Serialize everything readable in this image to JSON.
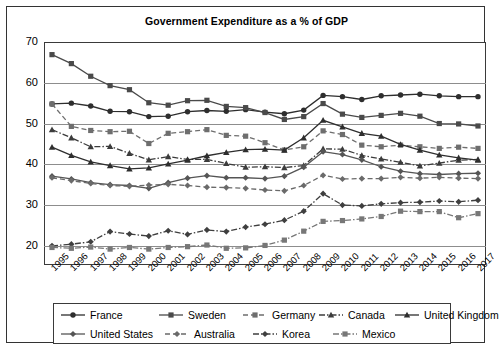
{
  "chart_data": {
    "type": "line",
    "title": "Government Expenditure as a % of GDP",
    "xlabel": "",
    "ylabel": "",
    "ylim": [
      15.3,
      70
    ],
    "yticks": [
      20,
      30,
      40,
      50,
      60,
      70
    ],
    "grid": true,
    "legend_position": "bottom",
    "categories": [
      "1995",
      "1996",
      "1997",
      "1998",
      "1999",
      "2000",
      "2001",
      "2002",
      "2003",
      "2004",
      "2005",
      "2006",
      "2007",
      "2008",
      "2009",
      "2010",
      "2011",
      "2012",
      "2013",
      "2014",
      "2015",
      "2016",
      "2017"
    ],
    "series": [
      {
        "name": "France",
        "marker": "circle",
        "dash": "solid",
        "color": "#2e2e2e",
        "values": [
          54.8,
          55.0,
          54.3,
          53.0,
          52.9,
          51.7,
          51.8,
          52.9,
          53.2,
          53.0,
          53.4,
          52.8,
          52.4,
          53.3,
          56.9,
          56.6,
          55.9,
          56.8,
          57.0,
          57.2,
          56.8,
          56.6,
          56.6
        ]
      },
      {
        "name": "Sweden",
        "marker": "square",
        "dash": "solid",
        "color": "#4a4a4a",
        "values": [
          66.9,
          64.7,
          61.6,
          59.3,
          58.3,
          55.1,
          54.5,
          55.6,
          55.7,
          54.2,
          53.9,
          52.7,
          51.0,
          51.7,
          54.9,
          52.3,
          51.5,
          52.0,
          52.5,
          51.8,
          50.0,
          49.9,
          49.4
        ]
      },
      {
        "name": "Germany",
        "marker": "square",
        "dash": "dashed",
        "color": "#6e6e6e",
        "values": [
          54.8,
          49.3,
          48.3,
          48.0,
          48.1,
          45.1,
          47.6,
          48.0,
          48.5,
          47.1,
          46.9,
          45.3,
          43.5,
          44.3,
          48.2,
          47.3,
          44.7,
          44.3,
          44.7,
          44.3,
          43.9,
          44.2,
          43.9
        ]
      },
      {
        "name": "Canada",
        "marker": "triangle",
        "dash": "dashdot",
        "color": "#3c3c3c",
        "values": [
          48.5,
          46.5,
          44.3,
          44.4,
          42.7,
          41.1,
          41.9,
          41.2,
          41.2,
          40.2,
          39.3,
          39.4,
          39.2,
          39.7,
          43.8,
          43.7,
          42.2,
          41.3,
          40.5,
          39.6,
          40.3,
          41.0,
          41.2
        ]
      },
      {
        "name": "United Kingdom",
        "marker": "triangle",
        "dash": "solid",
        "color": "#2e2e2e",
        "values": [
          44.2,
          42.2,
          40.6,
          39.7,
          38.9,
          39.1,
          40.1,
          41.0,
          42.1,
          42.9,
          43.6,
          43.7,
          43.5,
          46.5,
          50.8,
          49.2,
          47.6,
          46.9,
          44.9,
          43.5,
          42.3,
          41.6,
          41.0
        ]
      },
      {
        "name": "United States",
        "marker": "diamond",
        "dash": "solid",
        "color": "#555555",
        "values": [
          37.1,
          36.4,
          35.5,
          35.0,
          34.8,
          34.1,
          35.5,
          36.6,
          37.2,
          36.7,
          36.7,
          36.5,
          37.1,
          39.3,
          43.1,
          42.4,
          41.1,
          39.4,
          38.3,
          37.7,
          37.5,
          37.7,
          37.8
        ]
      },
      {
        "name": "Australia",
        "marker": "diamond",
        "dash": "dashed",
        "color": "#6a6a6a",
        "values": [
          36.7,
          36.0,
          35.3,
          34.8,
          34.6,
          34.9,
          35.1,
          34.8,
          34.4,
          34.3,
          34.1,
          33.7,
          33.5,
          34.8,
          37.3,
          36.4,
          36.5,
          36.5,
          36.8,
          36.6,
          36.8,
          36.6,
          36.5
        ]
      },
      {
        "name": "Korea",
        "marker": "diamond",
        "dash": "dashdot",
        "color": "#3f3f3f",
        "values": [
          20.0,
          20.4,
          21.0,
          23.5,
          22.9,
          22.4,
          23.7,
          22.8,
          23.9,
          23.5,
          24.6,
          25.3,
          26.3,
          28.5,
          32.8,
          30.0,
          29.8,
          30.3,
          30.6,
          30.7,
          31.0,
          30.8,
          31.2
        ]
      },
      {
        "name": "Mexico",
        "marker": "square",
        "dash": "dashdot",
        "color": "#777777",
        "values": [
          19.6,
          19.4,
          19.7,
          19.2,
          19.6,
          19.2,
          19.6,
          19.8,
          20.2,
          19.4,
          19.5,
          20.1,
          21.4,
          23.6,
          26.0,
          26.2,
          26.6,
          27.2,
          28.5,
          28.4,
          28.4,
          26.9,
          27.9
        ]
      }
    ]
  },
  "legend": {
    "rows": [
      [
        {
          "label": "France"
        },
        {
          "label": "Sweden"
        },
        {
          "label": "Germany"
        },
        {
          "label": "Canada"
        },
        {
          "label": "United Kingdom"
        }
      ],
      [
        {
          "label": "United States"
        },
        {
          "label": "Australia"
        },
        {
          "label": "Korea"
        },
        {
          "label": "Mexico"
        }
      ]
    ]
  },
  "colors": {
    "frame": "#333333",
    "grid": "#8d8d8d",
    "background": "#ffffff",
    "text": "#000000"
  }
}
